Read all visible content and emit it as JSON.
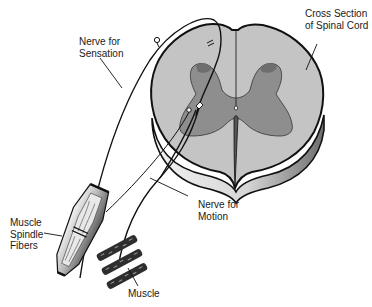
{
  "diagram": {
    "labels": {
      "nerve_sensation": [
        "Nerve for",
        "Sensation"
      ],
      "cross_section": [
        "Cross Section",
        "of Spinal Cord"
      ],
      "nerve_motion": [
        "Nerve for",
        "Motion"
      ],
      "muscle_spindle": [
        "Muscle",
        "Spindle",
        "Fibers"
      ],
      "muscle": "Muscle"
    },
    "colors": {
      "background": "#ffffff",
      "white_matter": "#c4c4c4",
      "gray_matter": "#8e8e8e",
      "cord_side_light": "#e6e6e6",
      "cord_side_dark": "#7a7a7a",
      "outline": "#111111",
      "spindle_outer": "#8a8a8a",
      "muscle_band": "#2e2e2e"
    }
  }
}
